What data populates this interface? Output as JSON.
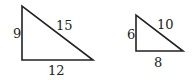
{
  "triangles": [
    {
      "name": "large",
      "vertices": [
        [
          22,
          6
        ],
        [
          22,
          60
        ],
        [
          93,
          60
        ]
      ],
      "labels": {
        "left": {
          "text": "9",
          "x": 13,
          "y": 38
        },
        "hypotenuse": {
          "text": "15",
          "x": 56,
          "y": 30
        },
        "bottom": {
          "text": "12",
          "x": 48,
          "y": 75
        }
      }
    },
    {
      "name": "small",
      "vertices": [
        [
          136,
          15
        ],
        [
          136,
          51
        ],
        [
          183,
          51
        ]
      ],
      "labels": {
        "left": {
          "text": "6",
          "x": 127,
          "y": 39
        },
        "hypotenuse": {
          "text": "10",
          "x": 157,
          "y": 29
        },
        "bottom": {
          "text": "8",
          "x": 154,
          "y": 67
        }
      }
    }
  ]
}
